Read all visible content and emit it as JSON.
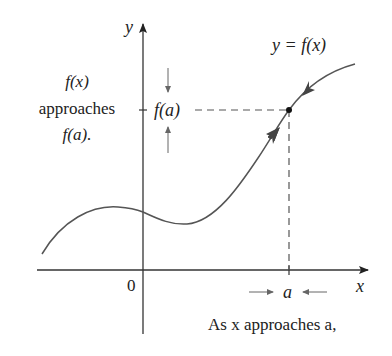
{
  "diagram": {
    "type": "limit-illustration",
    "axes": {
      "x_label": "x",
      "y_label": "y",
      "origin_label": "0"
    },
    "curve_label": "y = f(x)",
    "point": {
      "x_label": "a",
      "y_label": "f(a)"
    },
    "left_annotation": {
      "line1": "f(x)",
      "line2": "approaches",
      "line3": "f(a)."
    },
    "bottom_annotation": "As x approaches a,",
    "colors": {
      "curve": "#555555",
      "axes": "#333333",
      "text": "#222222",
      "dashed": "#555555"
    }
  }
}
